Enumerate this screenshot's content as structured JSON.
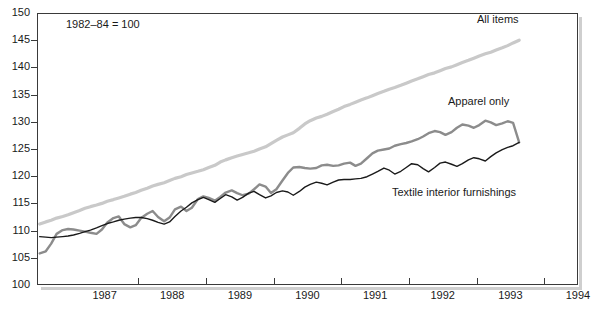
{
  "chart_data": {
    "type": "line",
    "title": "",
    "subtitle": "",
    "annotation": "1982–84 = 100",
    "xlabel": "",
    "ylabel": "",
    "ylim": [
      100,
      150
    ],
    "ytick_values": [
      100,
      105,
      110,
      115,
      120,
      125,
      130,
      135,
      140,
      145,
      150
    ],
    "ytick_labels": [
      "100",
      "105",
      "110",
      "115",
      "120",
      "125",
      "130",
      "135",
      "140",
      "145",
      "150"
    ],
    "xtick_labels": [
      "1987",
      "1988",
      "1989",
      "1990",
      "1991",
      "1992",
      "1993",
      "1994"
    ],
    "xlim": [
      1986.5,
      1994.5
    ],
    "x_tick_boundaries": [
      1987.0,
      1988.0,
      1989.0,
      1990.0,
      1991.0,
      1992.0,
      1993.0,
      1994.0
    ],
    "grid": false,
    "legend_position": "inline-labels",
    "colors": {
      "all_items": "#c9c9c9",
      "apparel_only": "#8c8c8c",
      "textile_interior_furnishings": "#1a1a1a",
      "axis": "#3a3a3a",
      "plot_background": "#ffffff",
      "shadow": "#cfcfcf"
    },
    "x": [
      1986.54,
      1986.63,
      1986.71,
      1986.79,
      1986.88,
      1986.96,
      1987.04,
      1987.13,
      1987.21,
      1987.29,
      1987.38,
      1987.46,
      1987.54,
      1987.63,
      1987.71,
      1987.79,
      1987.88,
      1987.96,
      1988.04,
      1988.13,
      1988.21,
      1988.29,
      1988.38,
      1988.46,
      1988.54,
      1988.63,
      1988.71,
      1988.79,
      1988.88,
      1988.96,
      1989.04,
      1989.13,
      1989.21,
      1989.29,
      1989.38,
      1989.46,
      1989.54,
      1989.63,
      1989.71,
      1989.79,
      1989.88,
      1989.96,
      1990.04,
      1990.13,
      1990.21,
      1990.29,
      1990.38,
      1990.46,
      1990.54,
      1990.63,
      1990.71,
      1990.79,
      1990.88,
      1990.96,
      1991.04,
      1991.13,
      1991.21,
      1991.29,
      1991.38,
      1991.46,
      1991.54,
      1991.63,
      1991.71,
      1991.79,
      1991.88,
      1991.96,
      1992.04,
      1992.13,
      1992.21,
      1992.29,
      1992.38,
      1992.46,
      1992.54,
      1992.63,
      1992.71,
      1992.79,
      1992.88,
      1992.96,
      1993.04,
      1993.13,
      1993.21,
      1993.29,
      1993.38,
      1993.46,
      1993.54,
      1993.63
    ],
    "series": [
      {
        "name": "All items",
        "color": "#c9c9c9",
        "values": [
          111.2,
          111.6,
          111.9,
          112.3,
          112.6,
          112.9,
          113.3,
          113.7,
          114.1,
          114.4,
          114.7,
          115.0,
          115.4,
          115.7,
          116.0,
          116.3,
          116.7,
          117.0,
          117.4,
          117.8,
          118.2,
          118.5,
          118.8,
          119.2,
          119.6,
          119.9,
          120.3,
          120.6,
          120.9,
          121.2,
          121.6,
          122.0,
          122.6,
          123.0,
          123.4,
          123.7,
          124.0,
          124.3,
          124.6,
          125.0,
          125.4,
          126.0,
          126.6,
          127.2,
          127.6,
          128.0,
          128.8,
          129.6,
          130.2,
          130.7,
          131.0,
          131.4,
          131.9,
          132.3,
          132.8,
          133.2,
          133.6,
          134.0,
          134.4,
          134.8,
          135.2,
          135.6,
          136.0,
          136.3,
          136.7,
          137.1,
          137.5,
          137.9,
          138.3,
          138.7,
          139.0,
          139.4,
          139.8,
          140.1,
          140.5,
          140.9,
          141.3,
          141.7,
          142.1,
          142.5,
          142.8,
          143.2,
          143.6,
          144.0,
          144.5,
          145.0
        ]
      },
      {
        "name": "Apparel only",
        "color": "#8c8c8c",
        "values": [
          105.8,
          106.2,
          107.6,
          109.4,
          110.1,
          110.3,
          110.2,
          110.0,
          109.8,
          109.6,
          109.4,
          110.2,
          111.5,
          112.3,
          112.6,
          111.2,
          110.6,
          111.0,
          112.3,
          113.1,
          113.6,
          112.5,
          111.7,
          112.4,
          113.9,
          114.4,
          113.6,
          114.2,
          115.8,
          116.3,
          116.0,
          115.5,
          116.2,
          117.0,
          117.4,
          116.9,
          116.5,
          116.8,
          117.6,
          118.5,
          118.1,
          116.9,
          117.6,
          119.2,
          120.6,
          121.6,
          121.7,
          121.5,
          121.4,
          121.5,
          122.0,
          122.1,
          121.9,
          122.0,
          122.3,
          122.5,
          121.9,
          122.3,
          123.3,
          124.2,
          124.7,
          124.9,
          125.1,
          125.6,
          125.9,
          126.1,
          126.4,
          126.8,
          127.3,
          127.9,
          128.3,
          128.1,
          127.6,
          128.1,
          128.9,
          129.5,
          129.3,
          128.9,
          129.4,
          130.2,
          129.9,
          129.4,
          129.7,
          130.1,
          129.8,
          126.2
        ]
      },
      {
        "name": "Textile interior furnishings",
        "color": "#1a1a1a",
        "values": [
          108.9,
          108.8,
          108.7,
          108.8,
          108.9,
          109.0,
          109.2,
          109.5,
          109.8,
          110.1,
          110.5,
          110.9,
          111.3,
          111.6,
          111.9,
          112.1,
          112.3,
          112.4,
          112.4,
          112.2,
          111.9,
          111.5,
          111.2,
          111.6,
          112.6,
          113.6,
          114.3,
          115.1,
          115.7,
          116.1,
          115.7,
          115.2,
          115.9,
          116.6,
          116.2,
          115.6,
          116.1,
          116.9,
          117.2,
          116.6,
          116.0,
          116.4,
          117.0,
          117.3,
          117.1,
          116.5,
          117.2,
          118.0,
          118.5,
          118.9,
          118.7,
          118.4,
          118.9,
          119.3,
          119.4,
          119.4,
          119.5,
          119.6,
          119.9,
          120.4,
          120.9,
          121.5,
          121.1,
          120.4,
          120.9,
          121.6,
          122.3,
          122.1,
          121.4,
          120.8,
          121.6,
          122.4,
          122.6,
          122.2,
          121.8,
          122.3,
          123.0,
          123.4,
          123.2,
          122.8,
          123.6,
          124.3,
          124.9,
          125.3,
          125.6,
          126.2
        ]
      }
    ]
  },
  "axis": {
    "yticks": [
      "150",
      "145",
      "140",
      "135",
      "130",
      "125",
      "120",
      "115",
      "110",
      "105",
      "100"
    ],
    "xticks": [
      "1987",
      "1988",
      "1989",
      "1990",
      "1991",
      "1992",
      "1993",
      "1994"
    ]
  },
  "labels": {
    "note": "1982–84 = 100",
    "all_items": "All items",
    "apparel_only": "Apparel only",
    "textile_interior_furnishings": "Textile interior furnishings"
  }
}
